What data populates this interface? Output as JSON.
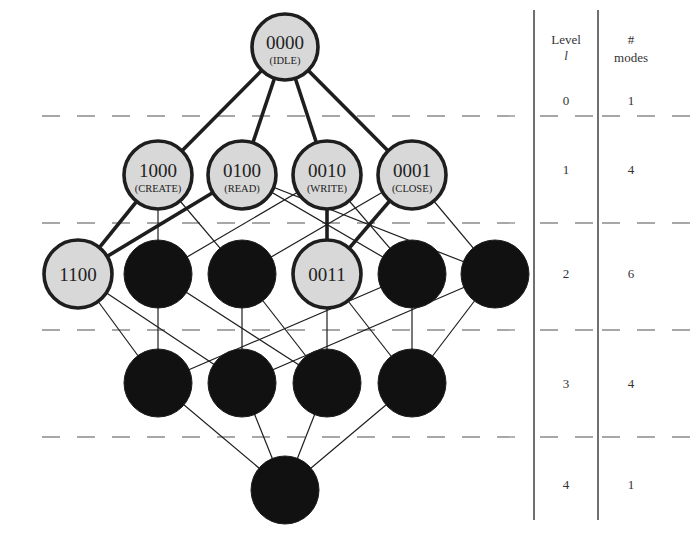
{
  "colors": {
    "background": "#ffffff",
    "active_fill": "#d8d8d8",
    "inactive_fill": "#111111",
    "stroke": "#1e1e1e",
    "dash": "#8a8a8a",
    "table_line": "#333333"
  },
  "table": {
    "header_level": "Level",
    "header_level_var": "l",
    "header_modes_hash": "#",
    "header_modes": "modes",
    "rows": [
      {
        "level": "0",
        "modes": "1"
      },
      {
        "level": "1",
        "modes": "4"
      },
      {
        "level": "2",
        "modes": "6"
      },
      {
        "level": "3",
        "modes": "4"
      },
      {
        "level": "4",
        "modes": "1"
      }
    ]
  },
  "nodes": [
    {
      "id": "n0000",
      "level": 0,
      "x": 285,
      "y": 47,
      "active": true,
      "code": "0000",
      "label": "(IDLE)"
    },
    {
      "id": "n1000",
      "level": 1,
      "x": 158,
      "y": 175,
      "active": true,
      "code": "1000",
      "label": "(CREATE)"
    },
    {
      "id": "n0100",
      "level": 1,
      "x": 242,
      "y": 175,
      "active": true,
      "code": "0100",
      "label": "(READ)"
    },
    {
      "id": "n0010",
      "level": 1,
      "x": 327,
      "y": 175,
      "active": true,
      "code": "0010",
      "label": "(WRITE)"
    },
    {
      "id": "n0001",
      "level": 1,
      "x": 412,
      "y": 175,
      "active": true,
      "code": "0001",
      "label": "(CLOSE)"
    },
    {
      "id": "n1100",
      "level": 2,
      "x": 78,
      "y": 274,
      "active": true,
      "code": "1100",
      "label": ""
    },
    {
      "id": "n1010",
      "level": 2,
      "x": 158,
      "y": 274,
      "active": false,
      "code": "",
      "label": ""
    },
    {
      "id": "n1001",
      "level": 2,
      "x": 242,
      "y": 274,
      "active": false,
      "code": "",
      "label": ""
    },
    {
      "id": "n0011",
      "level": 2,
      "x": 327,
      "y": 274,
      "active": true,
      "code": "0011",
      "label": ""
    },
    {
      "id": "n0110",
      "level": 2,
      "x": 412,
      "y": 274,
      "active": false,
      "code": "",
      "label": ""
    },
    {
      "id": "n0101",
      "level": 2,
      "x": 495,
      "y": 274,
      "active": false,
      "code": "",
      "label": ""
    },
    {
      "id": "n1110",
      "level": 3,
      "x": 158,
      "y": 383,
      "active": false,
      "code": "",
      "label": ""
    },
    {
      "id": "n1101",
      "level": 3,
      "x": 242,
      "y": 383,
      "active": false,
      "code": "",
      "label": ""
    },
    {
      "id": "n1011",
      "level": 3,
      "x": 327,
      "y": 383,
      "active": false,
      "code": "",
      "label": ""
    },
    {
      "id": "n0111",
      "level": 3,
      "x": 412,
      "y": 383,
      "active": false,
      "code": "",
      "label": ""
    },
    {
      "id": "n1111",
      "level": 4,
      "x": 285,
      "y": 490,
      "active": false,
      "code": "",
      "label": ""
    }
  ],
  "edges": [
    {
      "from": "n0000",
      "to": "n1000",
      "thick": true
    },
    {
      "from": "n0000",
      "to": "n0100",
      "thick": true
    },
    {
      "from": "n0000",
      "to": "n0010",
      "thick": true
    },
    {
      "from": "n0000",
      "to": "n0001",
      "thick": true
    },
    {
      "from": "n1000",
      "to": "n1100",
      "thick": true
    },
    {
      "from": "n0100",
      "to": "n1100",
      "thick": true
    },
    {
      "from": "n0010",
      "to": "n0011",
      "thick": true
    },
    {
      "from": "n0001",
      "to": "n0011",
      "thick": true
    },
    {
      "from": "n1000",
      "to": "n1010",
      "thick": false
    },
    {
      "from": "n1000",
      "to": "n1001",
      "thick": false
    },
    {
      "from": "n0100",
      "to": "n0110",
      "thick": false
    },
    {
      "from": "n0100",
      "to": "n0101",
      "thick": false
    },
    {
      "from": "n0010",
      "to": "n1010",
      "thick": false
    },
    {
      "from": "n0010",
      "to": "n0110",
      "thick": false
    },
    {
      "from": "n0001",
      "to": "n1001",
      "thick": false
    },
    {
      "from": "n0001",
      "to": "n0101",
      "thick": false
    },
    {
      "from": "n1100",
      "to": "n1110",
      "thick": false
    },
    {
      "from": "n1100",
      "to": "n1101",
      "thick": false
    },
    {
      "from": "n1010",
      "to": "n1110",
      "thick": false
    },
    {
      "from": "n1010",
      "to": "n1011",
      "thick": false
    },
    {
      "from": "n1001",
      "to": "n1101",
      "thick": false
    },
    {
      "from": "n1001",
      "to": "n1011",
      "thick": false
    },
    {
      "from": "n0011",
      "to": "n1011",
      "thick": false
    },
    {
      "from": "n0011",
      "to": "n0111",
      "thick": false
    },
    {
      "from": "n0110",
      "to": "n1110",
      "thick": false
    },
    {
      "from": "n0110",
      "to": "n0111",
      "thick": false
    },
    {
      "from": "n0101",
      "to": "n1101",
      "thick": false
    },
    {
      "from": "n0101",
      "to": "n0111",
      "thick": false
    },
    {
      "from": "n1110",
      "to": "n1111",
      "thick": false
    },
    {
      "from": "n1101",
      "to": "n1111",
      "thick": false
    },
    {
      "from": "n1011",
      "to": "n1111",
      "thick": false
    },
    {
      "from": "n0111",
      "to": "n1111",
      "thick": false
    }
  ],
  "dashed_lines_y": [
    116,
    223,
    330,
    437
  ]
}
